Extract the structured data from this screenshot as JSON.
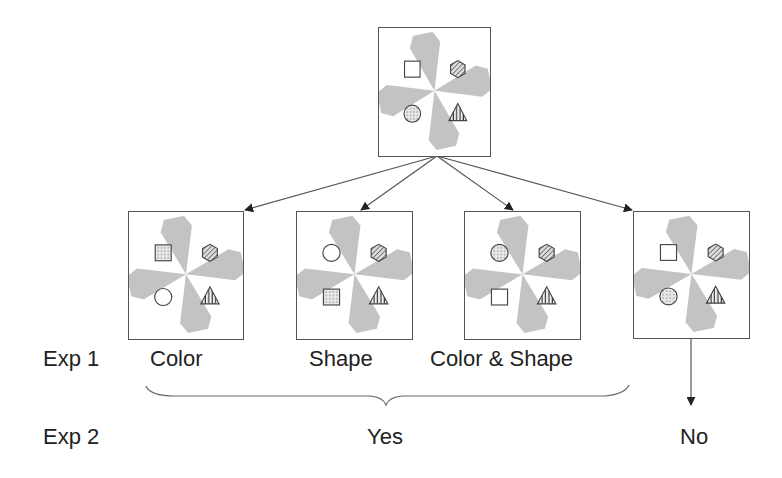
{
  "colors": {
    "gray_shape": "#c3c3c3",
    "outline": "#555555",
    "arrow": "#444444",
    "text": "#222222"
  },
  "top_stimulus": {
    "name": "original-display",
    "shapes": {
      "top_left": "square-empty",
      "top_right": "hexagon-hatched",
      "bottom_left": "circle-dotted",
      "bottom_right": "triangle-striped"
    }
  },
  "test_stimuli": [
    {
      "name": "color-change",
      "label": "Color",
      "shapes": {
        "top_left": "square-dotted",
        "top_right": "hexagon-hatched",
        "bottom_left": "circle-empty",
        "bottom_right": "triangle-striped"
      }
    },
    {
      "name": "shape-change",
      "label": "Shape",
      "shapes": {
        "top_left": "circle-empty",
        "top_right": "hexagon-hatched",
        "bottom_left": "square-dotted",
        "bottom_right": "triangle-striped"
      }
    },
    {
      "name": "color-shape-change",
      "label": "Color & Shape",
      "shapes": {
        "top_left": "circle-dotted",
        "top_right": "hexagon-hatched",
        "bottom_left": "square-empty",
        "bottom_right": "triangle-striped"
      }
    },
    {
      "name": "no-change",
      "label": "",
      "shapes": {
        "top_left": "square-empty",
        "top_right": "hexagon-hatched",
        "bottom_left": "circle-dotted",
        "bottom_right": "triangle-striped"
      }
    }
  ],
  "row_labels": {
    "exp1": "Exp 1",
    "exp2": "Exp 2"
  },
  "exp1_labels": [
    "Color",
    "Shape",
    "Color & Shape"
  ],
  "exp2_labels": {
    "yes": "Yes",
    "no": "No"
  }
}
